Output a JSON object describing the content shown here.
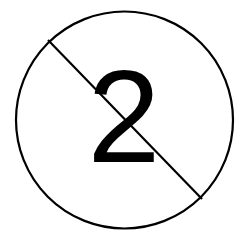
{
  "sign": {
    "type": "prohibition-sign",
    "label": "2",
    "stroke_color": "#000000",
    "fill_color": "#ffffff",
    "text_color": "#000000"
  }
}
